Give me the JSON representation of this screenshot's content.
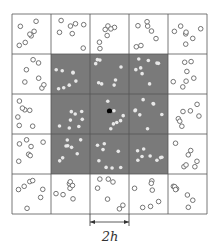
{
  "diagram": {
    "grid_rows": 5,
    "grid_cols": 5,
    "shaded_cells": {
      "row_start": 1,
      "row_end": 3,
      "col_start": 1,
      "col_end": 3
    },
    "colors": {
      "shade": "#7a7a7a",
      "grid_line": "#555555",
      "particle_outline": "#666666",
      "particle_inner": "#e8e8e8",
      "center_point": "#000000"
    },
    "center_point": "query-point",
    "dimension_label": "2h",
    "dimension_spans_cells": 1
  }
}
